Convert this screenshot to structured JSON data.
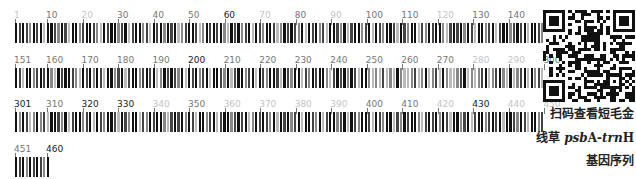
{
  "barcode": {
    "bars_per_row": 150,
    "total_length": 460,
    "bar_pitch_px": 3.553,
    "bar_width_px": 2.2,
    "colors": {
      "K": "#111111",
      "D": "#444444",
      "M": "#888888",
      "L": "#bbbbbb"
    },
    "rows": [
      {
        "top": 10,
        "start": 1,
        "end": 150,
        "labels": [
          {
            "text": "1",
            "pos": 1,
            "shade": "L"
          },
          {
            "text": "10",
            "pos": 10,
            "shade": "M"
          },
          {
            "text": "20",
            "pos": 20,
            "shade": "L"
          },
          {
            "text": "30",
            "pos": 30,
            "shade": "M"
          },
          {
            "text": "40",
            "pos": 40,
            "shade": "M"
          },
          {
            "text": "50",
            "pos": 50,
            "shade": "M"
          },
          {
            "text": "60",
            "pos": 60,
            "shade": "K"
          },
          {
            "text": "70",
            "pos": 70,
            "shade": "L"
          },
          {
            "text": "80",
            "pos": 80,
            "shade": "M"
          },
          {
            "text": "90",
            "pos": 90,
            "shade": "L"
          },
          {
            "text": "100",
            "pos": 100,
            "shade": "M"
          },
          {
            "text": "110",
            "pos": 110,
            "shade": "M"
          },
          {
            "text": "120",
            "pos": 120,
            "shade": "L"
          },
          {
            "text": "130",
            "pos": 130,
            "shade": "M"
          },
          {
            "text": "140",
            "pos": 140,
            "shade": "M"
          },
          {
            "text": "150",
            "pos": 150,
            "shade": "M"
          }
        ]
      },
      {
        "top": 55,
        "start": 151,
        "end": 300,
        "labels": [
          {
            "text": "151",
            "pos": 151,
            "shade": "M"
          },
          {
            "text": "160",
            "pos": 160,
            "shade": "M"
          },
          {
            "text": "170",
            "pos": 170,
            "shade": "M"
          },
          {
            "text": "180",
            "pos": 180,
            "shade": "M"
          },
          {
            "text": "190",
            "pos": 190,
            "shade": "M"
          },
          {
            "text": "200",
            "pos": 200,
            "shade": "K"
          },
          {
            "text": "210",
            "pos": 210,
            "shade": "M"
          },
          {
            "text": "220",
            "pos": 220,
            "shade": "M"
          },
          {
            "text": "230",
            "pos": 230,
            "shade": "M"
          },
          {
            "text": "240",
            "pos": 240,
            "shade": "M"
          },
          {
            "text": "250",
            "pos": 250,
            "shade": "M"
          },
          {
            "text": "260",
            "pos": 260,
            "shade": "M"
          },
          {
            "text": "270",
            "pos": 270,
            "shade": "M"
          },
          {
            "text": "280",
            "pos": 280,
            "shade": "L"
          },
          {
            "text": "290",
            "pos": 290,
            "shade": "L"
          },
          {
            "text": "300",
            "pos": 300,
            "shade": "M"
          }
        ]
      },
      {
        "top": 99,
        "start": 301,
        "end": 450,
        "labels": [
          {
            "text": "301",
            "pos": 301,
            "shade": "K"
          },
          {
            "text": "310",
            "pos": 310,
            "shade": "M"
          },
          {
            "text": "320",
            "pos": 320,
            "shade": "K"
          },
          {
            "text": "330",
            "pos": 330,
            "shade": "K"
          },
          {
            "text": "340",
            "pos": 340,
            "shade": "L"
          },
          {
            "text": "350",
            "pos": 350,
            "shade": "M"
          },
          {
            "text": "360",
            "pos": 360,
            "shade": "L"
          },
          {
            "text": "370",
            "pos": 370,
            "shade": "L"
          },
          {
            "text": "380",
            "pos": 380,
            "shade": "L"
          },
          {
            "text": "390",
            "pos": 390,
            "shade": "L"
          },
          {
            "text": "400",
            "pos": 400,
            "shade": "M"
          },
          {
            "text": "410",
            "pos": 410,
            "shade": "M"
          },
          {
            "text": "420",
            "pos": 420,
            "shade": "L"
          },
          {
            "text": "430",
            "pos": 430,
            "shade": "K"
          },
          {
            "text": "440",
            "pos": 440,
            "shade": "L"
          },
          {
            "text": "450",
            "pos": 450,
            "shade": "L"
          }
        ]
      },
      {
        "top": 144,
        "start": 451,
        "end": 460,
        "labels": [
          {
            "text": "451",
            "pos": 451,
            "shade": "M"
          },
          {
            "text": "460",
            "pos": 460,
            "shade": "K"
          }
        ]
      }
    ],
    "sequence_shades": "KDKDMKDKLKKDMKDLKKMDKKDMLKDKKMDKLDKKMDLKDKMKDKLMDKKDLMKDKDKMLKDKMDKLKDMKKDLMKDKDMKLKDKMDLKKDMKLDKKMDKLKDMKKDLKDMKKLDMKDKKMLDKDKMKDLKKMDKLDKKMDKDKLKKDMKDLKKMDKDKMLKDKKDMLKDKMKDLKKMDKLDKKMDKDKLMKDKDMKLKDKMDKLKKDMKLDKKMDKLKDMKKDLKDMKKLDMKDKKMLDKDKMKDLKKMLMLDLMLKMLLMDLMKLMDLKMLLMDKLMLMDKLMDKMLKLMDKLKMDLKMKDLMKMDLKKDMKLDKKMDKLKDMKKDLKDMKKLDMKDKKMLDKDKMKDLKKMDKLDKKMDKDKLMKDKDMKLKDKMDKLKKDMKLDKKMDKLKDMKKDLKDMKKLDMKDKKMLDKDKMKDLKKMDKLDKKMDKDKLKKDMKDLKKMDKDKM"
  },
  "qr": {
    "label": "qr-code"
  },
  "caption": {
    "line1": "扫码查看短毛金",
    "line2_prefix": "线草 ",
    "line2_gene_italic_1": "psb",
    "line2_gene_upright_1": "A-",
    "line2_gene_italic_2": "trn",
    "line2_gene_upright_2": "H",
    "line3": "基因序列"
  }
}
